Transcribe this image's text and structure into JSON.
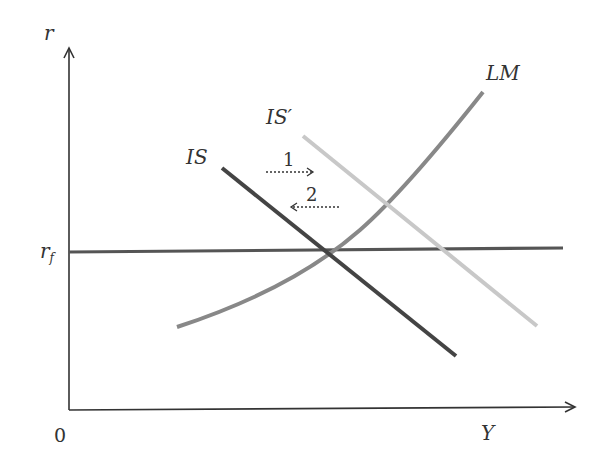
{
  "diagram": {
    "type": "IS-LM model with fixed interest rate (Mundell-Fleming)",
    "axes": {
      "y_label": "r",
      "x_label": "Y",
      "origin_label": "0"
    },
    "rf_label": "r",
    "rf_subscript": "f",
    "curves": {
      "is": {
        "label": "IS",
        "color": "#444444"
      },
      "is_prime": {
        "label": "IS′",
        "color": "#c8c8c8"
      },
      "lm": {
        "label": "LM",
        "color": "#888888"
      },
      "rf_line": {
        "color": "#555555"
      }
    },
    "arrows": [
      {
        "label": "1",
        "direction": "right"
      },
      {
        "label": "2",
        "direction": "left"
      }
    ]
  }
}
